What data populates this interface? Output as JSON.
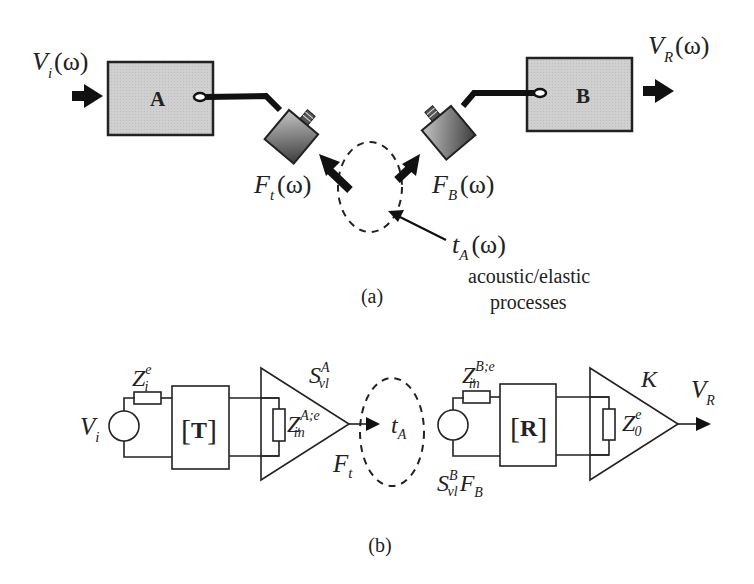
{
  "figure": {
    "panel_a": {
      "caption": "(a)",
      "block_a_label": "A",
      "block_b_label": "B",
      "input_label": {
        "base": "V",
        "sub": "i",
        "arg": "(ω)"
      },
      "output_label": {
        "base": "V",
        "sub": "R",
        "arg": "(ω)"
      },
      "force_t_label": {
        "base": "F",
        "sub": "t",
        "arg": "(ω)"
      },
      "force_b_label": {
        "base": "F",
        "sub": "B",
        "arg": "(ω)"
      },
      "transfer_label": {
        "base": "t",
        "sub": "A",
        "arg": "(ω)"
      },
      "process_line1": "acoustic/elastic",
      "process_line2": "processes"
    },
    "panel_b": {
      "caption": "(b)",
      "source_label": {
        "base": "V",
        "sub": "i"
      },
      "zi_label": {
        "base": "Z",
        "sup": "e",
        "sub": "i"
      },
      "t_matrix": {
        "open": "[",
        "letter": "T",
        "close": "]"
      },
      "zin_a_label": {
        "base": "Z",
        "sup": "A;e",
        "sub": "in"
      },
      "svl_a_label": {
        "base": "S",
        "sup": "A",
        "sub": "vl"
      },
      "ft_label": {
        "base": "F",
        "sub": "t"
      },
      "ta_label": {
        "base": "t",
        "sub": "A"
      },
      "zin_b_label": {
        "base": "Z",
        "sup": "B;e",
        "sub": "in"
      },
      "r_matrix": {
        "open": "[",
        "letter": "R",
        "close": "]"
      },
      "svl_b_label": {
        "base": "S",
        "sup": "B",
        "sub": "vl",
        "tail_base": "F",
        "tail_sub": "B"
      },
      "z0_label": {
        "base": "Z",
        "sup": "e",
        "sub": "0"
      },
      "k_label": "K",
      "vr_label": {
        "base": "V",
        "sub": "R"
      }
    },
    "colors": {
      "block_fill": "#cfcfcf",
      "stroke": "#222222",
      "sensor_dark": "#4a4a4a",
      "sensor_light": "#bdbdbd"
    }
  }
}
